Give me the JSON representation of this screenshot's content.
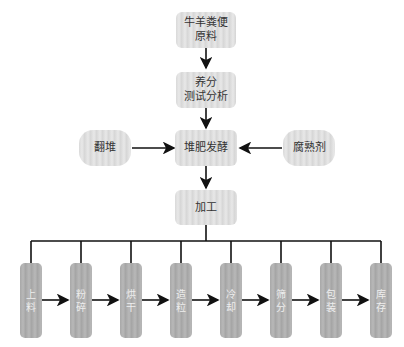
{
  "diagram": {
    "title_nodes": [
      {
        "id": "raw",
        "label_lines": [
          "牛羊粪便",
          "原料"
        ]
      },
      {
        "id": "test",
        "label_lines": [
          "养分",
          "测试分析"
        ]
      },
      {
        "id": "ferment",
        "label_lines": [
          "堆肥发酵"
        ]
      },
      {
        "id": "turn",
        "label_lines": [
          "翻堆"
        ]
      },
      {
        "id": "agent",
        "label_lines": [
          "腐熟剂"
        ]
      },
      {
        "id": "process",
        "label_lines": [
          "加工"
        ]
      }
    ],
    "process_steps": [
      {
        "label": "上料"
      },
      {
        "label": "粉碎"
      },
      {
        "label": "烘干"
      },
      {
        "label": "造粒"
      },
      {
        "label": "冷却"
      },
      {
        "label": "筛分"
      },
      {
        "label": "包装"
      },
      {
        "label": "库存"
      }
    ],
    "edges": [
      [
        "raw",
        "test"
      ],
      [
        "test",
        "ferment"
      ],
      [
        "turn",
        "ferment"
      ],
      [
        "agent",
        "ferment"
      ],
      [
        "ferment",
        "process"
      ],
      [
        "process",
        "steps-bus"
      ],
      [
        "上料",
        "粉碎"
      ],
      [
        "粉碎",
        "烘干"
      ],
      [
        "烘干",
        "造粒"
      ],
      [
        "造粒",
        "冷却"
      ],
      [
        "冷却",
        "筛分"
      ],
      [
        "筛分",
        "包装"
      ],
      [
        "包装",
        "库存"
      ]
    ],
    "colors": {
      "top_box": "#dcdcdc",
      "step_box": "#aaaaaa",
      "line": "#111111"
    }
  }
}
